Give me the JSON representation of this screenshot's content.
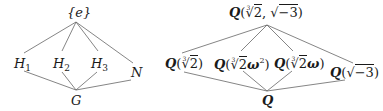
{
  "left_diagram": {
    "nodes": {
      "top": {
        "label": "{e}"
      },
      "h1": {
        "base": "H",
        "sub": "1"
      },
      "h2": {
        "base": "H",
        "sub": "2"
      },
      "h3": {
        "base": "H",
        "sub": "3"
      },
      "n": {
        "label": "N"
      },
      "bottom": {
        "label": "G"
      }
    },
    "edges": [
      [
        "top",
        "h1"
      ],
      [
        "top",
        "h2"
      ],
      [
        "top",
        "h3"
      ],
      [
        "top",
        "n"
      ],
      [
        "h1",
        "bottom"
      ],
      [
        "h2",
        "bottom"
      ],
      [
        "h3",
        "bottom"
      ],
      [
        "n",
        "bottom"
      ]
    ]
  },
  "right_diagram": {
    "field_symbol": "Q",
    "nodes": {
      "top": {
        "root_index": "3",
        "radicand": "2",
        "sep": ", ",
        "sqrt_radicand": "−3"
      },
      "f1": {
        "root_index": "3",
        "radicand": "2",
        "extra": ""
      },
      "f2": {
        "root_index": "3",
        "radicand": "2",
        "extra": "ω",
        "extra_sup": "2"
      },
      "f3": {
        "root_index": "3",
        "radicand": "2",
        "extra": "ω"
      },
      "f4": {
        "sqrt_radicand": "−3"
      },
      "bottom": {
        "label": "Q"
      }
    },
    "edges": [
      [
        "top",
        "f1"
      ],
      [
        "top",
        "f2"
      ],
      [
        "top",
        "f3"
      ],
      [
        "top",
        "f4"
      ],
      [
        "f1",
        "bottom"
      ],
      [
        "f2",
        "bottom"
      ],
      [
        "f3",
        "bottom"
      ],
      [
        "f4",
        "bottom"
      ]
    ]
  },
  "colors": {
    "line": "#555555",
    "text": "#1a1a1a"
  },
  "glyphs": {
    "open": "(",
    "close": ")",
    "radical": "√"
  }
}
